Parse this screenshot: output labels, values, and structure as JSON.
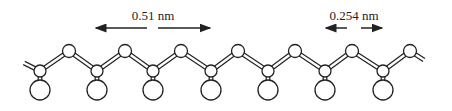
{
  "diagram": {
    "type": "zigzag polymer chain (ball-and-stick)",
    "labels": {
      "repeat_distance": "0.51 nm",
      "bond_projection": "0.254 nm"
    },
    "colors": {
      "stroke": "#222222",
      "fill": "#ffffff"
    },
    "top_atoms_x": [
      69,
      125,
      181,
      238,
      295,
      352,
      410
    ],
    "backbone_atoms_x": [
      40,
      97,
      153,
      211,
      268,
      325,
      383
    ],
    "top_y": 51,
    "backbone_y": 71,
    "side_y": 90
  }
}
